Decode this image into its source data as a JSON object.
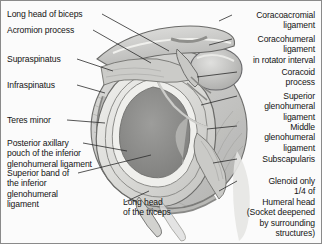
{
  "figure": {
    "background_color": "#fbfbfb",
    "border_color": "#8a8a8a",
    "text_color": "#141414",
    "leader_line_color": "#2b2b2b",
    "illustration": {
      "name": "shoulder-glenoid-cross-section",
      "style": "grayscale-anatomical-drawing",
      "palette": {
        "bone_light": "#d8d8d6",
        "bone_mid": "#bdbdbb",
        "bone_shadow": "#9b9b99",
        "capsule": "#c9c9c7",
        "labrum_ring": "#8e8e8c",
        "glenoid_fossa": "#8b8b8a",
        "cartilage_highlight": "#efefec",
        "outline": "#555553",
        "muscle_striation": "#a9a9a6"
      }
    }
  },
  "labels": {
    "left": [
      {
        "id": "long-head-of-biceps",
        "text": "Long head of biceps"
      },
      {
        "id": "acromion-process",
        "text": "Acromion process"
      },
      {
        "id": "supraspinatus",
        "text": "Supraspinatus"
      },
      {
        "id": "infraspinatus",
        "text": "Infraspinatus"
      },
      {
        "id": "teres-minor",
        "text": "Teres minor"
      },
      {
        "id": "posterior-axillary-pouch",
        "text": "Posterior axillary\npouch of the inferior\nglenohumeral ligament"
      },
      {
        "id": "superior-band-inferior-ghl",
        "text": "Superior band of\nthe inferior\nglenohumeral\nligament"
      }
    ],
    "bottom": [
      {
        "id": "long-head-of-the-triceps",
        "text": "Long head\nof the triceps"
      }
    ],
    "right": [
      {
        "id": "coracoacromial-ligament",
        "text": "Coracoacromial\nligament"
      },
      {
        "id": "coracohumeral-ligament",
        "text": "Coracohumeral\nligament\nin rotator interval"
      },
      {
        "id": "coracoid-process",
        "text": "Coracoid\nprocess"
      },
      {
        "id": "superior-glenohumeral-ligament",
        "text": "Superior\nglenohumeral\nligament"
      },
      {
        "id": "middle-glenohumeral-ligament",
        "text": "Middle\nglenohumeral\nligament"
      },
      {
        "id": "subscapularis",
        "text": "Subscapularis"
      },
      {
        "id": "glenoid-note",
        "text": "Glenoid only\n1/4 of\nHumeral head\n(Socket deepened\nby surrounding\nstructures)"
      }
    ]
  }
}
